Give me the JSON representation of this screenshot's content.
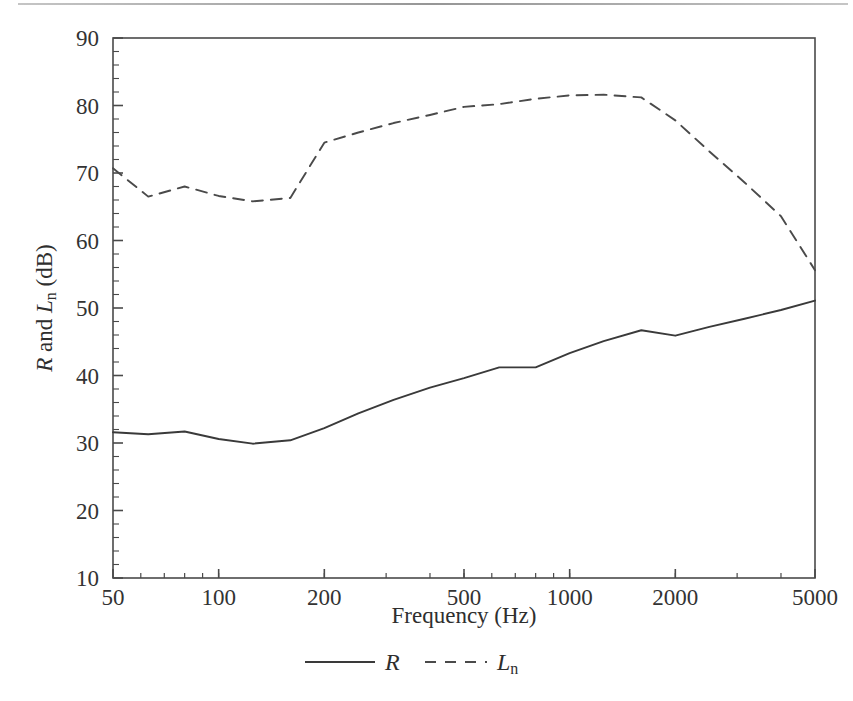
{
  "figure": {
    "background_color": "#ffffff",
    "ink_color": "#3a3a3a",
    "axis_color": "#4a4a4a"
  },
  "chart_data": {
    "type": "line",
    "title": "",
    "subtitle": "",
    "xlabel": "Frequency (Hz)",
    "ylabel": "R and Lₙ (dB)",
    "ylabel_parts": {
      "r": "R",
      "and": " and ",
      "l": "L",
      "sub": "n",
      "unit": " (dB)"
    },
    "xscale": "log",
    "yscale": "linear",
    "xlim": [
      50,
      5000
    ],
    "ylim": [
      10,
      90
    ],
    "xticks": [
      50,
      100,
      200,
      500,
      1000,
      2000,
      5000
    ],
    "xtick_labels": [
      "50",
      "100",
      "200",
      "500",
      "1000",
      "2000",
      "5000"
    ],
    "yticks": [
      10,
      20,
      30,
      40,
      50,
      60,
      70,
      80,
      90
    ],
    "ytick_labels": [
      "10",
      "20",
      "30",
      "40",
      "50",
      "60",
      "70",
      "80",
      "90"
    ],
    "y_minor_step": 2,
    "grid": false,
    "legend_position": "below-axes",
    "x": [
      50,
      63,
      80,
      100,
      125,
      160,
      200,
      250,
      315,
      400,
      500,
      630,
      800,
      1000,
      1250,
      1600,
      2000,
      2500,
      3150,
      4000,
      5000
    ],
    "series": [
      {
        "name": "R",
        "label": "R",
        "linestyle": "solid",
        "color": "#3a3a3a",
        "values": [
          31.6,
          31.3,
          31.7,
          30.6,
          29.9,
          30.4,
          32.2,
          34.4,
          36.4,
          38.2,
          39.6,
          41.2,
          41.2,
          43.3,
          45.1,
          46.7,
          45.9,
          47.2,
          48.4,
          49.7,
          51.1
        ]
      },
      {
        "name": "Ln",
        "label": "L",
        "label_sub": "n",
        "linestyle": "dashed",
        "color": "#4a4a4a",
        "values": [
          70.7,
          66.5,
          68.0,
          66.6,
          65.8,
          66.3,
          74.5,
          76.0,
          77.4,
          78.6,
          79.8,
          80.2,
          81.0,
          81.5,
          81.6,
          81.2,
          77.8,
          73.2,
          68.6,
          63.6,
          55.6
        ]
      }
    ],
    "legend": [
      {
        "label": "R",
        "sub": "",
        "linestyle": "solid"
      },
      {
        "label": "L",
        "sub": "n",
        "linestyle": "dashed"
      }
    ]
  }
}
